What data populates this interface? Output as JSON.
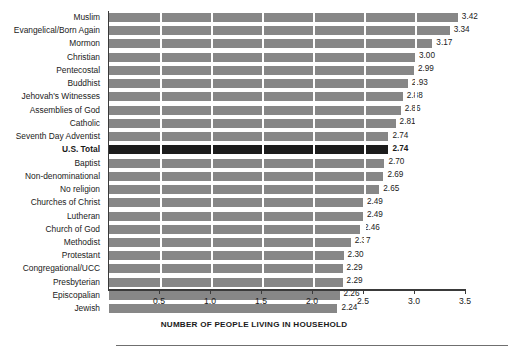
{
  "chart_data": {
    "type": "bar",
    "orientation": "horizontal",
    "title": "",
    "subtitle": "",
    "xlabel": "NUMBER OF PEOPLE LIVING IN HOUSEHOLD",
    "ylabel": "",
    "xlim": [
      0,
      3.5
    ],
    "xticks": [
      "0.5",
      "1.0",
      "1.5",
      "2.0",
      "2.5",
      "3.0",
      "3.5"
    ],
    "xtick_values": [
      0.5,
      1.0,
      1.5,
      2.0,
      2.5,
      3.0,
      3.5
    ],
    "grid": "vertical-white-gridlines-at-xticks",
    "legend": "none",
    "bar_color": "#878787",
    "highlight_color": "#1c1c1c",
    "highlight_category": "U.S. Total",
    "categories": [
      "Muslim",
      "Evangelical/Born Again",
      "Mormon",
      "Christian",
      "Pentecostal",
      "Buddhist",
      "Jehovah's Witnesses",
      "Assemblies of God",
      "Catholic",
      "Seventh Day Adventist",
      "U.S. Total",
      "Baptist",
      "Non-denominational",
      "No religion",
      "Churches of Christ",
      "Lutheran",
      "Church of God",
      "Methodist",
      "Protestant",
      "Congregational/UCC",
      "Presbyterian",
      "Episcopalian",
      "Jewish"
    ],
    "values": [
      3.42,
      3.34,
      3.17,
      3.0,
      2.99,
      2.93,
      2.88,
      2.86,
      2.81,
      2.74,
      2.74,
      2.7,
      2.69,
      2.65,
      2.49,
      2.49,
      2.46,
      2.37,
      2.3,
      2.29,
      2.29,
      2.26,
      2.24
    ],
    "value_labels": [
      "3.42",
      "3.34",
      "3.17",
      "3.00",
      "2.99",
      "2.93",
      "2.88",
      "2.86",
      "2.81",
      "2.74",
      "2.74",
      "2.70",
      "2.69",
      "2.65",
      "2.49",
      "2.49",
      "2.46",
      "2.37",
      "2.30",
      "2.29",
      "2.29",
      "2.26",
      "2.24"
    ]
  }
}
